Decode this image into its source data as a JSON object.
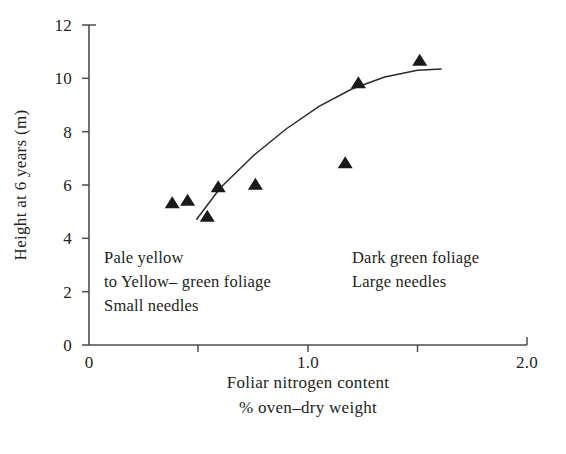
{
  "figure": {
    "background_color": "#ffffff",
    "ink_color": "#231f20"
  },
  "y_axis": {
    "title": "Height at 6 years (m)",
    "ticks": [
      "0",
      "2",
      "4",
      "6",
      "8",
      "10",
      "12"
    ],
    "tick_values": [
      0,
      2,
      4,
      6,
      8,
      10,
      12
    ],
    "min": 0,
    "max": 12
  },
  "x_axis": {
    "title_line1": "Foliar nitrogen content",
    "title_line2": "% oven–dry weight",
    "ticks": [
      "0",
      "1.0",
      "2.0"
    ],
    "tick_values": [
      0,
      0.5,
      1.0,
      1.5,
      2.0
    ],
    "labeled_tick_values": [
      0,
      1.0,
      2.0
    ],
    "min": 0,
    "max": 2.0
  },
  "annotations": {
    "left": {
      "lines": [
        "Pale yellow",
        "to Yellow– green foliage",
        "Small needles"
      ],
      "line1": "Pale yellow",
      "line2": "to Yellow– green foliage",
      "line3": "Small needles"
    },
    "right": {
      "lines": [
        "Dark green foliage",
        "Large needles"
      ],
      "line1": "Dark green foliage",
      "line2": "Large needles"
    }
  },
  "chart_data": {
    "type": "scatter",
    "title": "",
    "xlabel": "Foliar nitrogen content % oven–dry weight",
    "ylabel": "Height at 6 years (m)",
    "xlim": [
      0,
      2.0
    ],
    "ylim": [
      0,
      12
    ],
    "grid": false,
    "legend": null,
    "marker": "triangle-up-filled",
    "marker_color": "#1a1a1a",
    "points": [
      {
        "x": 0.38,
        "y": 5.35
      },
      {
        "x": 0.45,
        "y": 5.45
      },
      {
        "x": 0.54,
        "y": 4.85
      },
      {
        "x": 0.59,
        "y": 5.95
      },
      {
        "x": 0.76,
        "y": 6.05
      },
      {
        "x": 1.17,
        "y": 6.85
      },
      {
        "x": 1.23,
        "y": 9.85
      },
      {
        "x": 1.51,
        "y": 10.7
      }
    ],
    "fit_curve": {
      "type": "smooth-sigmoid-trend",
      "x": [
        0.49,
        0.6,
        0.75,
        0.9,
        1.05,
        1.2,
        1.35,
        1.5,
        1.61
      ],
      "y": [
        4.7,
        5.9,
        7.1,
        8.1,
        8.95,
        9.6,
        10.05,
        10.3,
        10.35
      ]
    },
    "annotations": [
      {
        "text": "Pale yellow to Yellow– green foliage Small needles",
        "x": 0.1,
        "y": 3.6
      },
      {
        "text": "Dark green foliage Large needles",
        "x": 1.2,
        "y": 3.6
      }
    ]
  }
}
